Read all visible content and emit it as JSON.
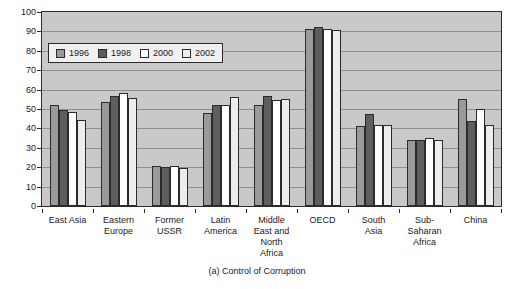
{
  "chart_data": {
    "type": "bar",
    "title": "",
    "caption": "(a) Control of Corruption",
    "xlabel": "",
    "ylabel": "",
    "ylim": [
      0,
      100
    ],
    "yticks": [
      0,
      10,
      20,
      30,
      40,
      50,
      60,
      70,
      80,
      90,
      100
    ],
    "grid": true,
    "legend_position": "top-left",
    "categories": [
      "East Asia",
      "Eastern Europe",
      "Former USSR",
      "Latin America",
      "Middle East and North Africa",
      "OECD",
      "South Asia",
      "Sub-Saharan Africa",
      "China"
    ],
    "category_lines": [
      [
        "East Asia"
      ],
      [
        "Eastern",
        "Europe"
      ],
      [
        "Former",
        "USSR"
      ],
      [
        "Latin",
        "America"
      ],
      [
        "Middle",
        "East and",
        "North",
        "Africa"
      ],
      [
        "OECD"
      ],
      [
        "South",
        "Asia"
      ],
      [
        "Sub-",
        "Saharan",
        "Africa"
      ],
      [
        "China"
      ]
    ],
    "series": [
      {
        "name": "1996",
        "color": "#9a9a9a",
        "values": [
          52,
          53.5,
          20.5,
          48,
          52,
          91.5,
          41,
          34,
          55
        ]
      },
      {
        "name": "1998",
        "color": "#5e5e5e",
        "values": [
          49.5,
          56.5,
          20,
          52,
          56.5,
          92.5,
          47.5,
          34,
          44
        ]
      },
      {
        "name": "2000",
        "color": "#ffffff",
        "values": [
          48.5,
          58.5,
          20.5,
          52,
          54.5,
          91.5,
          42,
          35,
          50
        ]
      },
      {
        "name": "2002",
        "color": "#ededed",
        "values": [
          44.5,
          55.5,
          19.5,
          56,
          55,
          90.5,
          42,
          34,
          42
        ]
      }
    ]
  }
}
